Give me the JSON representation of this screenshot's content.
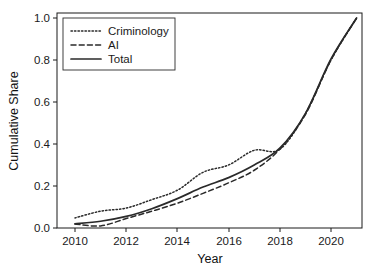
{
  "chart_data": {
    "type": "line",
    "title": "",
    "xlabel": "Year",
    "ylabel": "Cumulative Share",
    "xlim": [
      2009.3,
      2021.5
    ],
    "ylim": [
      0.0,
      1.0
    ],
    "grid": false,
    "legend_position": "top-left",
    "x_ticks": [
      "2010",
      "2012",
      "2014",
      "2016",
      "2018",
      "2020"
    ],
    "x_tick_values": [
      2010,
      2012,
      2014,
      2016,
      2018,
      2020
    ],
    "y_ticks": [
      "0.0",
      "0.2",
      "0.4",
      "0.6",
      "0.8",
      "1.0"
    ],
    "y_tick_values": [
      0.0,
      0.2,
      0.4,
      0.6,
      0.8,
      1.0
    ],
    "x": [
      2010,
      2011,
      2012,
      2013,
      2014,
      2015,
      2016,
      2017,
      2018,
      2019,
      2020,
      2021
    ],
    "series": [
      {
        "name": "Criminology",
        "style": "dotted",
        "color": "#2a2a2a",
        "values": [
          0.048,
          0.08,
          0.095,
          0.135,
          0.18,
          0.265,
          0.3,
          0.37,
          0.375,
          0.545,
          0.8,
          1.0
        ]
      },
      {
        "name": "AI",
        "style": "dashed",
        "color": "#2a2a2a",
        "values": [
          0.019,
          0.01,
          0.045,
          0.08,
          0.118,
          0.165,
          0.215,
          0.275,
          0.375,
          0.54,
          0.8,
          1.0
        ]
      },
      {
        "name": "Total",
        "style": "solid",
        "color": "#2a2a2a",
        "values": [
          0.02,
          0.032,
          0.055,
          0.092,
          0.14,
          0.195,
          0.24,
          0.3,
          0.38,
          0.545,
          0.805,
          1.0
        ]
      }
    ]
  },
  "legend": {
    "entries": [
      {
        "label": "Criminology",
        "style": "dotted"
      },
      {
        "label": "AI",
        "style": "dashed"
      },
      {
        "label": "Total",
        "style": "solid"
      }
    ]
  },
  "axes": {
    "x_title": "Year",
    "y_title": "Cumulative Share"
  }
}
